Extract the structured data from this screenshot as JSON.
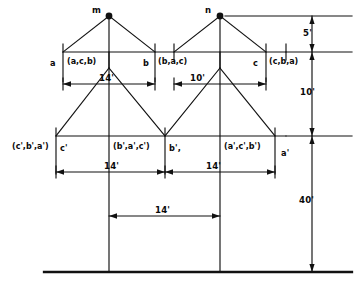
{
  "diagram": {
    "ink_color": "#111111",
    "background": "#ffffff"
  },
  "nodes": {
    "ground_wire_left": "m",
    "ground_wire_right": "n"
  },
  "upper_conductors": [
    {
      "name": "a",
      "tuple": "(a,c,b)"
    },
    {
      "name": "b",
      "tuple": "(b,a,c)"
    },
    {
      "name": "c",
      "tuple": "(c,b,a)"
    }
  ],
  "lower_conductors": [
    {
      "tuple": "(c',b',a')",
      "name": "c'"
    },
    {
      "tuple": "(b',a',c')",
      "name": "b',"
    },
    {
      "tuple": "(a',c',b')",
      "name": "a'"
    }
  ],
  "horizontal_dimensions": {
    "upper": [
      {
        "value": "14'"
      },
      {
        "value": "10'"
      }
    ],
    "lower": [
      {
        "value": "14'"
      },
      {
        "value": "14'"
      }
    ],
    "bottom": [
      {
        "value": "14'"
      }
    ]
  },
  "vertical_dimensions": [
    {
      "value": "5'"
    },
    {
      "value": "10'"
    },
    {
      "value": "40'"
    }
  ]
}
